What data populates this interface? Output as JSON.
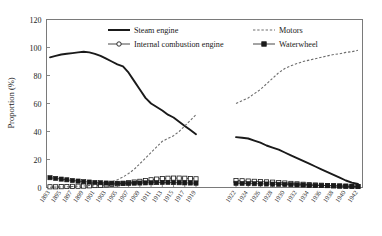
{
  "chart_data": {
    "type": "line",
    "title": "",
    "xlabel": "",
    "ylabel": "Proportion (%)",
    "ylim": [
      0,
      120
    ],
    "yticks": [
      0,
      20,
      40,
      60,
      80,
      100,
      120
    ],
    "grid": false,
    "legend_position": "top-inside",
    "panels": [
      {
        "name": "left-period",
        "x": [
          1893,
          1894,
          1895,
          1896,
          1897,
          1898,
          1899,
          1900,
          1901,
          1902,
          1903,
          1904,
          1905,
          1906,
          1907,
          1908,
          1909,
          1910,
          1911,
          1912,
          1913,
          1914,
          1915,
          1916,
          1917,
          1918,
          1919
        ],
        "xticks": [
          "1893",
          "1895",
          "1897",
          "1899",
          "1901",
          "1903",
          "1905",
          "1907",
          "1909",
          "1911",
          "1913",
          "1915",
          "1917",
          "1919"
        ]
      },
      {
        "name": "right-period",
        "x": [
          1922,
          1923,
          1924,
          1925,
          1926,
          1927,
          1928,
          1929,
          1930,
          1931,
          1932,
          1933,
          1934,
          1935,
          1936,
          1937,
          1938,
          1939,
          1940,
          1941,
          1942
        ],
        "xticks": [
          "1922",
          "1924",
          "1926",
          "1928",
          "1930",
          "1932",
          "1934",
          "1936",
          "1938",
          "1940",
          "1942"
        ]
      }
    ],
    "series": [
      {
        "name": "Steam engine",
        "style": "solid-thick",
        "color": "#1a1a1a",
        "marker": "none",
        "left_values": [
          93,
          94,
          95,
          95.5,
          96,
          96.5,
          97,
          96.5,
          95.5,
          94,
          92,
          90,
          88,
          86.5,
          82,
          76,
          70,
          64,
          60,
          57.5,
          55,
          52,
          50,
          47,
          44,
          41,
          38
        ],
        "right_values": [
          36,
          35.5,
          35,
          33.5,
          32,
          30,
          28.5,
          27,
          25,
          23,
          21,
          19,
          17,
          15,
          13,
          11,
          9,
          7,
          5,
          3.5,
          2.5
        ]
      },
      {
        "name": "Internal combustion engine",
        "style": "dashed-marker",
        "color": "#1a1a1a",
        "marker": "open-square",
        "left_values": [
          0.5,
          0.5,
          0.6,
          0.7,
          0.8,
          0.9,
          1,
          1.2,
          1.4,
          1.6,
          1.9,
          2.2,
          2.6,
          3,
          3.4,
          3.9,
          4.4,
          5,
          5.5,
          6,
          6.4,
          6.6,
          6.7,
          6.7,
          6.6,
          6.4,
          6.2
        ],
        "right_values": [
          5,
          4.8,
          4.6,
          4.4,
          4.2,
          4,
          3.8,
          3.5,
          3.2,
          2.9,
          2.6,
          2.3,
          2,
          1.8,
          1.6,
          1.4,
          1.2,
          1,
          0.9,
          0.8,
          0.7
        ]
      },
      {
        "name": "Motors",
        "style": "dotted",
        "color": "#6e6e6e",
        "marker": "none",
        "left_values": [
          0.2,
          0.3,
          0.4,
          0.5,
          0.7,
          0.9,
          1.1,
          1.4,
          1.8,
          2.3,
          3,
          4,
          5.5,
          7.5,
          10,
          13,
          17,
          21,
          25,
          29,
          33,
          35,
          37,
          40,
          44,
          48,
          52
        ],
        "right_values": [
          60,
          62,
          64,
          67,
          70,
          74,
          78,
          82,
          85,
          87,
          88.5,
          90,
          91,
          92,
          93,
          94,
          95,
          95.5,
          96.5,
          97,
          98
        ]
      },
      {
        "name": "Waterwheel",
        "style": "solid-marker",
        "color": "#1a1a1a",
        "marker": "filled-square",
        "left_values": [
          7,
          6.5,
          6,
          5.5,
          5,
          4.6,
          4.2,
          3.9,
          3.6,
          3.4,
          3.2,
          3.1,
          3,
          3,
          3,
          3.1,
          3.2,
          3.3,
          3.4,
          3.5,
          3.6,
          3.6,
          3.5,
          3.4,
          3.3,
          3.2,
          3.1
        ],
        "right_values": [
          3,
          2.9,
          2.8,
          2.7,
          2.6,
          2.5,
          2.4,
          2.3,
          2.2,
          2,
          1.9,
          1.8,
          1.6,
          1.5,
          1.4,
          1.3,
          1.2,
          1.1,
          1,
          0.9,
          0.8
        ]
      }
    ],
    "legend": [
      {
        "label": "Steam engine",
        "style": "solid-thick",
        "marker": "none",
        "color": "#1a1a1a"
      },
      {
        "label": "Motors",
        "style": "dotted",
        "marker": "none",
        "color": "#6e6e6e"
      },
      {
        "label": "Internal combustion engine",
        "style": "dashed-marker",
        "marker": "open-circle",
        "color": "#1a1a1a"
      },
      {
        "label": "Waterwheel",
        "style": "solid-marker",
        "marker": "filled-square",
        "color": "#1a1a1a"
      }
    ]
  }
}
